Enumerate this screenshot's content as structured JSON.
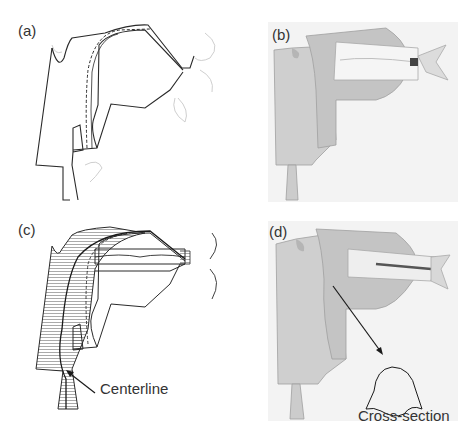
{
  "figure": {
    "panels": [
      {
        "id": "a",
        "label": "(a)",
        "type": "2d-midsagittal-outline"
      },
      {
        "id": "b",
        "label": "(b)",
        "type": "3d-vocal-tract-render"
      },
      {
        "id": "c",
        "label": "(c)",
        "type": "2d-hatched-area-with-centerline"
      },
      {
        "id": "d",
        "label": "(d)",
        "type": "3d-render-with-cross-section"
      }
    ],
    "annotations": {
      "centerline": "Centerline",
      "cross_section": "Cross-section"
    },
    "colors": {
      "line": "#2a2a2a",
      "faint_line": "#c8c8c8",
      "render_bg": "#f3f3f3",
      "surface": "#cfcfcf",
      "surface_dark": "#a9a9a9",
      "teeth": "#f5f5f5"
    }
  }
}
